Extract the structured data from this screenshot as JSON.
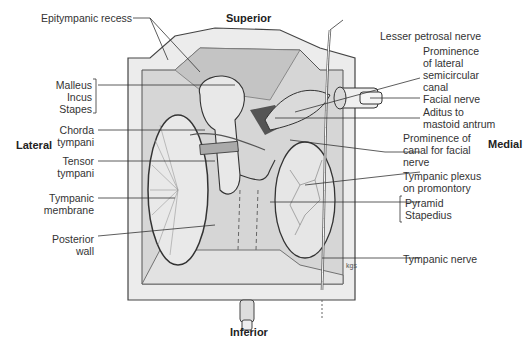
{
  "orientation": {
    "superior": "Superior",
    "inferior": "Inferior",
    "lateral": "Lateral",
    "medial": "Medial"
  },
  "labels_left": [
    {
      "id": "epitympanic-recess",
      "lines": [
        "Epitympanic recess"
      ]
    },
    {
      "id": "ossicles",
      "lines": [
        "Malleus",
        "Incus",
        "Stapes"
      ]
    },
    {
      "id": "chorda-tympani",
      "lines": [
        "Chorda",
        "tympani"
      ]
    },
    {
      "id": "tensor-tympani",
      "lines": [
        "Tensor",
        "tympani"
      ]
    },
    {
      "id": "tympanic-membrane",
      "lines": [
        "Tympanic",
        "membrane"
      ]
    },
    {
      "id": "posterior-wall",
      "lines": [
        "Posterior",
        "wall"
      ]
    }
  ],
  "labels_right": [
    {
      "id": "lesser-petrosal-nerve",
      "lines": [
        "Lesser petrosal nerve"
      ]
    },
    {
      "id": "prominence-lateral-semicircular-canal",
      "lines": [
        "Prominence",
        "of lateral",
        "semicircular",
        "canal"
      ]
    },
    {
      "id": "facial-nerve",
      "lines": [
        "Facial nerve"
      ]
    },
    {
      "id": "aditus-mastoid-antrum",
      "lines": [
        "Aditus to",
        "mastoid antrum"
      ]
    },
    {
      "id": "prominence-canal-facial-nerve",
      "lines": [
        "Prominence of",
        "canal for facial",
        "nerve"
      ]
    },
    {
      "id": "tympanic-plexus",
      "lines": [
        "Tympanic plexus",
        "on promontory"
      ]
    },
    {
      "id": "pyramid-stapedius",
      "lines": [
        "Pyramid",
        "Stapedius"
      ]
    },
    {
      "id": "tympanic-nerve",
      "lines": [
        "Tympanic nerve"
      ]
    }
  ],
  "artist_signature": "kgs",
  "colors": {
    "frame_light": "#e6e6e6",
    "wall_mid": "#cfcfcf",
    "wall_dark": "#b5b5b5",
    "antrum_dark": "#555555",
    "line": "#333333"
  }
}
